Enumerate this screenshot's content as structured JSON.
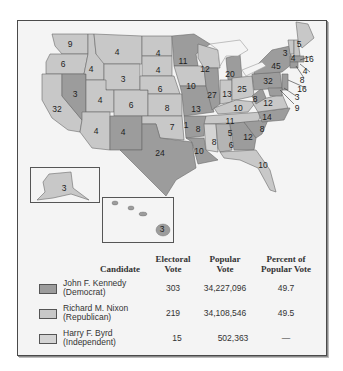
{
  "map": {
    "title": "Presidential Election of 1960",
    "colors": {
      "kennedy": "#9c9c9c",
      "nixon": "#c8c8c8",
      "byrd": "#d4d4d4",
      "water": "#f4f4f4",
      "border": "#6a6a6a"
    },
    "states": [
      {
        "name": "Washington",
        "ev": "9",
        "winner": "nixon"
      },
      {
        "name": "Oregon",
        "ev": "6",
        "winner": "nixon"
      },
      {
        "name": "California",
        "ev": "32",
        "winner": "nixon"
      },
      {
        "name": "Nevada",
        "ev": "3",
        "winner": "kennedy"
      },
      {
        "name": "Idaho",
        "ev": "4",
        "winner": "nixon"
      },
      {
        "name": "Montana",
        "ev": "4",
        "winner": "nixon"
      },
      {
        "name": "Wyoming",
        "ev": "3",
        "winner": "nixon"
      },
      {
        "name": "Utah",
        "ev": "4",
        "winner": "nixon"
      },
      {
        "name": "Colorado",
        "ev": "6",
        "winner": "nixon"
      },
      {
        "name": "Arizona",
        "ev": "4",
        "winner": "nixon"
      },
      {
        "name": "New Mexico",
        "ev": "4",
        "winner": "kennedy"
      },
      {
        "name": "North Dakota",
        "ev": "4",
        "winner": "nixon"
      },
      {
        "name": "South Dakota",
        "ev": "4",
        "winner": "nixon"
      },
      {
        "name": "Nebraska",
        "ev": "6",
        "winner": "nixon"
      },
      {
        "name": "Kansas",
        "ev": "8",
        "winner": "nixon"
      },
      {
        "name": "Oklahoma",
        "ev": "7",
        "winner": "nixon"
      },
      {
        "name": "Oklahoma (Byrd)",
        "ev": "1",
        "winner": "byrd"
      },
      {
        "name": "Texas",
        "ev": "24",
        "winner": "kennedy"
      },
      {
        "name": "Minnesota",
        "ev": "11",
        "winner": "kennedy"
      },
      {
        "name": "Iowa",
        "ev": "10",
        "winner": "nixon"
      },
      {
        "name": "Missouri",
        "ev": "13",
        "winner": "kennedy"
      },
      {
        "name": "Arkansas",
        "ev": "8",
        "winner": "kennedy"
      },
      {
        "name": "Louisiana",
        "ev": "10",
        "winner": "kennedy"
      },
      {
        "name": "Wisconsin",
        "ev": "12",
        "winner": "nixon"
      },
      {
        "name": "Illinois",
        "ev": "27",
        "winner": "kennedy"
      },
      {
        "name": "Michigan",
        "ev": "20",
        "winner": "kennedy"
      },
      {
        "name": "Indiana",
        "ev": "13",
        "winner": "nixon"
      },
      {
        "name": "Ohio",
        "ev": "25",
        "winner": "nixon"
      },
      {
        "name": "Kentucky",
        "ev": "10",
        "winner": "nixon"
      },
      {
        "name": "Tennessee",
        "ev": "11",
        "winner": "nixon"
      },
      {
        "name": "Mississippi",
        "ev": "8",
        "winner": "byrd"
      },
      {
        "name": "Alabama (Kennedy)",
        "ev": "5",
        "winner": "kennedy"
      },
      {
        "name": "Alabama (Byrd)",
        "ev": "6",
        "winner": "byrd"
      },
      {
        "name": "Georgia",
        "ev": "12",
        "winner": "kennedy"
      },
      {
        "name": "Florida",
        "ev": "10",
        "winner": "nixon"
      },
      {
        "name": "South Carolina",
        "ev": "8",
        "winner": "kennedy"
      },
      {
        "name": "North Carolina",
        "ev": "14",
        "winner": "kennedy"
      },
      {
        "name": "Virginia",
        "ev": "12",
        "winner": "nixon"
      },
      {
        "name": "West Virginia",
        "ev": "8",
        "winner": "kennedy"
      },
      {
        "name": "Pennsylvania",
        "ev": "32",
        "winner": "kennedy"
      },
      {
        "name": "New York",
        "ev": "45",
        "winner": "kennedy"
      },
      {
        "name": "Vermont",
        "ev": "3",
        "winner": "nixon"
      },
      {
        "name": "New Hampshire",
        "ev": "4",
        "winner": "nixon"
      },
      {
        "name": "Maine",
        "ev": "5",
        "winner": "nixon"
      },
      {
        "name": "Massachusetts",
        "ev": "16",
        "winner": "kennedy"
      },
      {
        "name": "Rhode Island",
        "ev": "4",
        "winner": "kennedy"
      },
      {
        "name": "Connecticut",
        "ev": "8",
        "winner": "kennedy"
      },
      {
        "name": "New Jersey",
        "ev": "16",
        "winner": "kennedy"
      },
      {
        "name": "Delaware",
        "ev": "3",
        "winner": "kennedy"
      },
      {
        "name": "Maryland",
        "ev": "9",
        "winner": "kennedy"
      },
      {
        "name": "Alaska",
        "ev": "3",
        "winner": "nixon"
      },
      {
        "name": "Hawaii",
        "ev": "3",
        "winner": "kennedy"
      }
    ]
  },
  "legend": {
    "headers": {
      "candidate": "Candidate",
      "electoral_1": "Electoral",
      "electoral_2": "Vote",
      "popular_1": "Popular",
      "popular_2": "Vote",
      "percent_1": "Percent of",
      "percent_2": "Popular Vote"
    },
    "rows": [
      {
        "name": "John F. Kennedy",
        "party": "(Democrat)",
        "electoral": "303",
        "popular": "34,227,096",
        "percent": "49.7",
        "color": "#9c9c9c"
      },
      {
        "name": "Richard M. Nixon",
        "party": "(Republican)",
        "electoral": "219",
        "popular": "34,108,546",
        "percent": "49.5",
        "color": "#c8c8c8"
      },
      {
        "name": "Harry F. Byrd",
        "party": "(Independent)",
        "electoral": "15",
        "popular": "502,363",
        "percent": "—",
        "color": "#d4d4d4"
      }
    ]
  }
}
